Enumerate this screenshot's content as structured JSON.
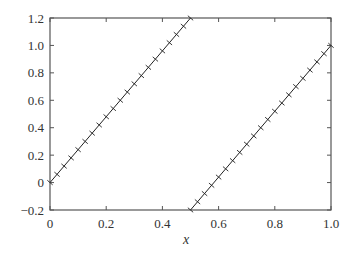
{
  "chart_data": {
    "type": "line",
    "title": "",
    "xlabel": "x",
    "ylabel": "",
    "xlim": [
      0,
      1.0
    ],
    "ylim": [
      -0.2,
      1.2
    ],
    "grid": false,
    "legend": null,
    "x_ticks": [
      "0",
      "0.2",
      "0.4",
      "0.6",
      "0.8",
      "1.0"
    ],
    "y_ticks": [
      "−0.2",
      "0",
      "0.2",
      "0.4",
      "0.6",
      "0.8",
      "1.0",
      "1.2"
    ],
    "series": [
      {
        "name": "segment-1",
        "x": [
          0,
          0.5
        ],
        "y": [
          0,
          1.2
        ],
        "marker": "perpendicular-tick",
        "color": "#222222"
      },
      {
        "name": "segment-2",
        "x": [
          0.5,
          1.0
        ],
        "y": [
          -0.2,
          1.0
        ],
        "marker": "perpendicular-tick",
        "color": "#222222"
      }
    ],
    "marker_spacing_x": 0.025
  }
}
